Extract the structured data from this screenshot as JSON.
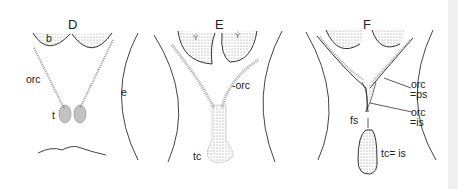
{
  "figure": {
    "panels": [
      {
        "id": "D",
        "label": "D",
        "parts": {
          "b": "b",
          "orc": "orc",
          "t": "t",
          "e": "e"
        }
      },
      {
        "id": "E",
        "label": "E",
        "parts": {
          "orc": "-orc",
          "tc": "tc"
        }
      },
      {
        "id": "F",
        "label": "F",
        "parts": {
          "orc_ps_1": "orc",
          "orc_ps_2": "=ps",
          "orc_is_1": "orc",
          "orc_is_2": "=is",
          "fs": "fs",
          "tc_is": "tc= is"
        }
      }
    ],
    "colors": {
      "line": "#333333",
      "stipple": "#bbbbbb",
      "background": "#ffffff"
    }
  }
}
